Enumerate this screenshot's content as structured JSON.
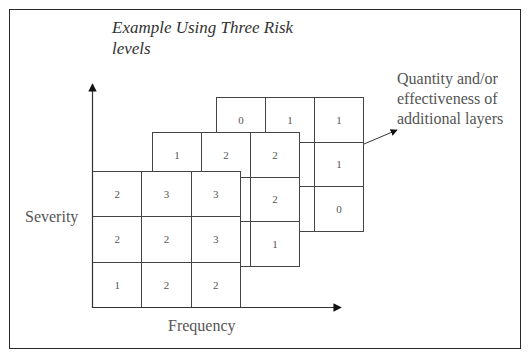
{
  "title": "Example Using Three Risk levels",
  "axes": {
    "y_label": "Severity",
    "x_label": "Frequency"
  },
  "annotation": "Quantity and/or effectiveness of additional layers",
  "layers": {
    "back": {
      "rows": [
        [
          "0",
          "1",
          "1"
        ],
        [
          "",
          "",
          "1"
        ],
        [
          "",
          "",
          "0"
        ]
      ]
    },
    "middle": {
      "rows": [
        [
          "1",
          "2",
          "2"
        ],
        [
          "",
          "",
          "2"
        ],
        [
          "",
          "",
          "1"
        ]
      ]
    },
    "front": {
      "rows": [
        [
          "2",
          "3",
          "3"
        ],
        [
          "2",
          "2",
          "3"
        ],
        [
          "1",
          "2",
          "2"
        ]
      ]
    }
  },
  "colors": {
    "line": "#444444",
    "text": "#555555",
    "frame": "#2a2a2a"
  }
}
